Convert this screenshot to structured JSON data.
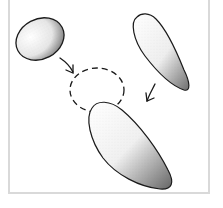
{
  "diagram": {
    "colors": {
      "stroke": "#1a1a1a",
      "frame": "#d9d9d9",
      "shade": "#8a8a8a",
      "background": "#ffffff"
    },
    "shapes": [
      {
        "name": "egg-blob",
        "position": "top-left"
      },
      {
        "name": "teardrop-blob",
        "position": "top-right"
      },
      {
        "name": "dashed-target-circle",
        "position": "center"
      },
      {
        "name": "teardrop-result",
        "position": "bottom-center"
      }
    ],
    "arrows": [
      {
        "from": "egg-blob",
        "to": "dashed-target-circle"
      },
      {
        "from": "teardrop-blob",
        "to": "dashed-target-circle"
      }
    ]
  }
}
